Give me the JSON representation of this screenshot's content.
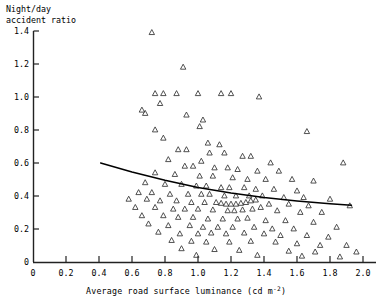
{
  "chart_data": {
    "type": "scatter",
    "title": "",
    "ylabel": "Night/day\naccident ratio",
    "ylabel_line1": "Night/day",
    "ylabel_line2": "accident ratio",
    "xlabel": "Average road surface luminance (cd m",
    "xlabel_sup": "-2",
    "xlabel_tail": ")",
    "xlim": [
      0,
      2.1
    ],
    "ylim": [
      0,
      1.4
    ],
    "xticks": [
      0,
      0.2,
      0.4,
      0.6,
      0.8,
      1.0,
      1.2,
      1.4,
      1.6,
      1.8,
      2.0
    ],
    "xtick_labels": [
      "0",
      "0.2",
      "0.4",
      "0.6",
      "0.8",
      "1.0",
      "1.2",
      "1.4",
      "1.6",
      "1.8",
      "2.0"
    ],
    "yticks": [
      0,
      0.2,
      0.4,
      0.6,
      0.8,
      1.0,
      1.2,
      1.4
    ],
    "ytick_labels": [
      "0",
      "0.2",
      "0.4",
      "0.6",
      "0.8",
      "1.0",
      "1.2",
      "1.4"
    ],
    "grid": false,
    "legend": null,
    "marker": "open-triangle",
    "marker_size": 5,
    "marker_color": "#333333",
    "line_color": "#000000",
    "points": [
      [
        0.72,
        1.39
      ],
      [
        0.91,
        1.18
      ],
      [
        0.74,
        1.02
      ],
      [
        0.79,
        1.02
      ],
      [
        0.87,
        1.02
      ],
      [
        1.0,
        1.02
      ],
      [
        1.14,
        1.02
      ],
      [
        1.2,
        1.02
      ],
      [
        1.37,
        1.0
      ],
      [
        0.77,
        0.96
      ],
      [
        0.66,
        0.92
      ],
      [
        0.68,
        0.9
      ],
      [
        0.93,
        0.89
      ],
      [
        1.03,
        0.86
      ],
      [
        1.01,
        0.82
      ],
      [
        0.74,
        0.8
      ],
      [
        1.66,
        0.79
      ],
      [
        0.79,
        0.75
      ],
      [
        1.06,
        0.72
      ],
      [
        1.13,
        0.71
      ],
      [
        0.88,
        0.68
      ],
      [
        0.93,
        0.68
      ],
      [
        1.07,
        0.66
      ],
      [
        1.16,
        0.66
      ],
      [
        1.27,
        0.64
      ],
      [
        1.32,
        0.64
      ],
      [
        0.82,
        0.62
      ],
      [
        1.02,
        0.61
      ],
      [
        1.44,
        0.6
      ],
      [
        0.92,
        0.58
      ],
      [
        0.97,
        0.58
      ],
      [
        1.1,
        0.57
      ],
      [
        1.18,
        0.57
      ],
      [
        1.24,
        0.56
      ],
      [
        1.36,
        0.55
      ],
      [
        1.49,
        0.55
      ],
      [
        0.74,
        0.54
      ],
      [
        0.86,
        0.53
      ],
      [
        1.01,
        0.52
      ],
      [
        1.09,
        0.52
      ],
      [
        1.21,
        0.51
      ],
      [
        1.3,
        0.5
      ],
      [
        1.41,
        0.5
      ],
      [
        1.57,
        0.5
      ],
      [
        1.7,
        0.49
      ],
      [
        0.68,
        0.48
      ],
      [
        0.8,
        0.47
      ],
      [
        0.9,
        0.47
      ],
      [
        0.99,
        0.46
      ],
      [
        1.05,
        0.46
      ],
      [
        1.14,
        0.45
      ],
      [
        1.19,
        0.45
      ],
      [
        1.28,
        0.45
      ],
      [
        1.35,
        0.44
      ],
      [
        1.46,
        0.44
      ],
      [
        1.6,
        0.43
      ],
      [
        1.88,
        0.6
      ],
      [
        0.64,
        0.42
      ],
      [
        0.72,
        0.42
      ],
      [
        0.83,
        0.41
      ],
      [
        0.94,
        0.41
      ],
      [
        1.02,
        0.41
      ],
      [
        1.07,
        0.41
      ],
      [
        1.16,
        0.4
      ],
      [
        1.23,
        0.4
      ],
      [
        1.31,
        0.4
      ],
      [
        1.39,
        0.4
      ],
      [
        1.52,
        0.39
      ],
      [
        1.64,
        0.39
      ],
      [
        1.8,
        0.38
      ],
      [
        0.58,
        0.38
      ],
      [
        0.69,
        0.38
      ],
      [
        0.77,
        0.37
      ],
      [
        0.87,
        0.37
      ],
      [
        0.96,
        0.36
      ],
      [
        1.04,
        0.36
      ],
      [
        1.11,
        0.36
      ],
      [
        1.14,
        0.355
      ],
      [
        1.17,
        0.35
      ],
      [
        1.2,
        0.35
      ],
      [
        1.23,
        0.35
      ],
      [
        1.26,
        0.355
      ],
      [
        1.29,
        0.36
      ],
      [
        1.32,
        0.37
      ],
      [
        1.35,
        0.375
      ],
      [
        1.43,
        0.35
      ],
      [
        1.55,
        0.35
      ],
      [
        1.67,
        0.34
      ],
      [
        1.92,
        0.34
      ],
      [
        0.62,
        0.33
      ],
      [
        0.74,
        0.33
      ],
      [
        0.85,
        0.32
      ],
      [
        0.92,
        0.32
      ],
      [
        1.0,
        0.32
      ],
      [
        1.09,
        0.315
      ],
      [
        1.18,
        0.31
      ],
      [
        1.22,
        0.31
      ],
      [
        1.27,
        0.315
      ],
      [
        1.33,
        0.32
      ],
      [
        1.38,
        0.33
      ],
      [
        1.48,
        0.31
      ],
      [
        1.62,
        0.3
      ],
      [
        1.75,
        0.3
      ],
      [
        0.66,
        0.28
      ],
      [
        0.79,
        0.28
      ],
      [
        0.88,
        0.27
      ],
      [
        0.97,
        0.27
      ],
      [
        1.06,
        0.26
      ],
      [
        1.15,
        0.26
      ],
      [
        1.24,
        0.26
      ],
      [
        1.3,
        0.265
      ],
      [
        1.41,
        0.25
      ],
      [
        1.53,
        0.25
      ],
      [
        1.7,
        0.24
      ],
      [
        0.7,
        0.23
      ],
      [
        0.82,
        0.22
      ],
      [
        0.95,
        0.22
      ],
      [
        1.03,
        0.21
      ],
      [
        1.12,
        0.21
      ],
      [
        1.21,
        0.21
      ],
      [
        1.34,
        0.21
      ],
      [
        1.45,
        0.2
      ],
      [
        1.58,
        0.2
      ],
      [
        1.84,
        0.21
      ],
      [
        0.76,
        0.18
      ],
      [
        0.89,
        0.17
      ],
      [
        1.0,
        0.17
      ],
      [
        1.08,
        0.175
      ],
      [
        1.17,
        0.17
      ],
      [
        1.28,
        0.175
      ],
      [
        1.4,
        0.17
      ],
      [
        1.5,
        0.16
      ],
      [
        1.66,
        0.16
      ],
      [
        1.79,
        0.15
      ],
      [
        0.84,
        0.13
      ],
      [
        0.96,
        0.125
      ],
      [
        1.05,
        0.12
      ],
      [
        1.19,
        0.12
      ],
      [
        1.32,
        0.125
      ],
      [
        1.47,
        0.12
      ],
      [
        1.6,
        0.11
      ],
      [
        1.74,
        0.1
      ],
      [
        1.9,
        0.1
      ],
      [
        0.9,
        0.08
      ],
      [
        1.1,
        0.075
      ],
      [
        1.25,
        0.07
      ],
      [
        1.55,
        0.065
      ],
      [
        1.71,
        0.06
      ],
      [
        1.96,
        0.06
      ],
      [
        0.99,
        0.04
      ],
      [
        1.36,
        0.04
      ],
      [
        1.63,
        0.035
      ],
      [
        1.86,
        0.03
      ]
    ],
    "trend_line": {
      "name": "fitted regression curve",
      "points": [
        [
          0.41,
          0.6
        ],
        [
          0.6,
          0.545
        ],
        [
          0.8,
          0.495
        ],
        [
          1.0,
          0.452
        ],
        [
          1.2,
          0.418
        ],
        [
          1.4,
          0.391
        ],
        [
          1.6,
          0.37
        ],
        [
          1.8,
          0.353
        ],
        [
          1.93,
          0.344
        ]
      ]
    }
  }
}
